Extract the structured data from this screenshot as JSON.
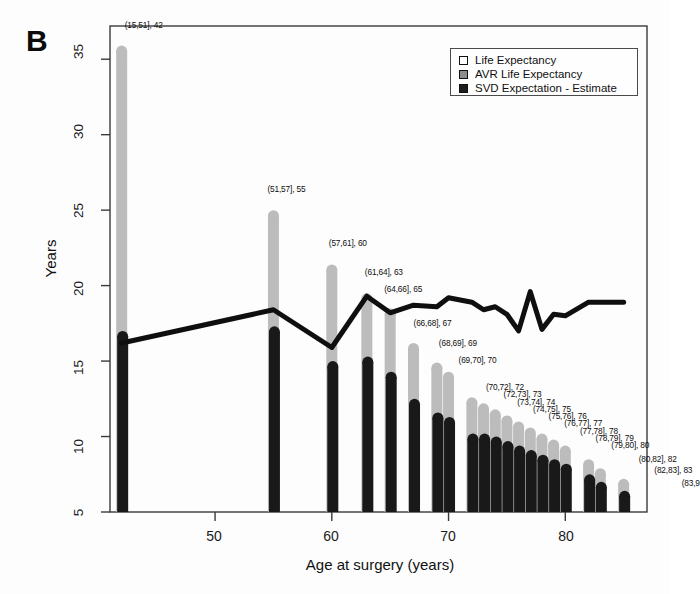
{
  "figure": {
    "panel_letter": "B",
    "ylabel": "Years",
    "xlabel": "Age at surgery (years)"
  },
  "legend": {
    "items": [
      {
        "label": "Life Expectancy",
        "swatch": "legend-swatch-life-expectancy",
        "color": "#ffffff"
      },
      {
        "label": "AVR Life Expectancy",
        "swatch": "legend-swatch-avr-life-expectancy",
        "color": "#9a9a9a"
      },
      {
        "label": "SVD Expectation - Estimate",
        "swatch": "legend-swatch-svd-expectation",
        "color": "#1a1a1a"
      }
    ]
  },
  "chart_data": {
    "type": "bar",
    "title": "",
    "xlabel": "Age at surgery (years)",
    "ylabel": "Years",
    "xlim": [
      41,
      87
    ],
    "ylim": [
      5,
      37.2
    ],
    "xticks": [
      50,
      60,
      70,
      80
    ],
    "yticks": [
      5,
      10,
      15,
      20,
      25,
      30,
      35
    ],
    "grid": false,
    "legend_position": "top-right",
    "colors": {
      "life_expectancy": "#b9b9b9",
      "avr_life_expectancy": "#141414",
      "svd_expectation": "#1a1a1a"
    },
    "categories": [
      "(15,51]",
      "(51,57]",
      "(57,61]",
      "(61,64]",
      "(64,66]",
      "(66,68]",
      "(68,69]",
      "(69,70]",
      "(70,72]",
      "(72,73]",
      "(73,74]",
      "(74,75]",
      "(75,76]",
      "(76,77]",
      "(77,78]",
      "(78,79]",
      "(79,80]",
      "(80,82]",
      "(82,83]",
      "(83,9"
    ],
    "x": [
      42,
      55,
      60,
      63,
      65,
      67,
      69,
      70,
      72,
      73,
      74,
      75,
      76,
      77,
      78,
      79,
      80,
      82,
      83,
      85
    ],
    "bar_labels": [
      "(15,51], 42",
      "(51,57], 55",
      "(57,61], 60",
      "(61,64], 63",
      "(64,66], 65",
      "(66,68], 67",
      "(68,69], 69",
      "(69,70], 70",
      "(70,72], 72",
      "(72,73], 73",
      "(73,74], 74",
      "(74,75], 75",
      "(75,76], 76",
      "(76,77], 77",
      "(77,78], 78",
      "(78,79], 79",
      "(79,80], 80",
      "(80,82], 82",
      "(82,83], 83",
      "(83,9"
    ],
    "series": [
      {
        "name": "Life Expectancy",
        "values": [
          35.9,
          25.0,
          21.4,
          19.5,
          18.5,
          16.2,
          14.9,
          14.3,
          12.6,
          12.2,
          11.8,
          11.4,
          11.0,
          10.6,
          10.2,
          9.8,
          9.4,
          8.5,
          7.9,
          7.2
        ]
      },
      {
        "name": "SVD Expectation - Estimate",
        "values": [
          17.0,
          17.3,
          15.0,
          15.3,
          14.3,
          12.5,
          11.6,
          11.3,
          10.2,
          10.2,
          10.0,
          9.7,
          9.4,
          9.1,
          8.8,
          8.5,
          8.2,
          7.5,
          7.0,
          6.4
        ]
      },
      {
        "name": "AVR Life Expectancy",
        "values": [
          16.2,
          18.4,
          15.9,
          19.3,
          18.2,
          18.7,
          18.6,
          19.2,
          18.9,
          18.4,
          18.6,
          18.1,
          17.0,
          19.6,
          17.1,
          18.1,
          18.0,
          18.9,
          18.9,
          18.9
        ]
      }
    ]
  },
  "axis_ticks": {
    "y": [
      "35",
      "30",
      "25",
      "20",
      "15",
      "10",
      "5"
    ],
    "x": [
      "50",
      "60",
      "70",
      "80"
    ]
  }
}
